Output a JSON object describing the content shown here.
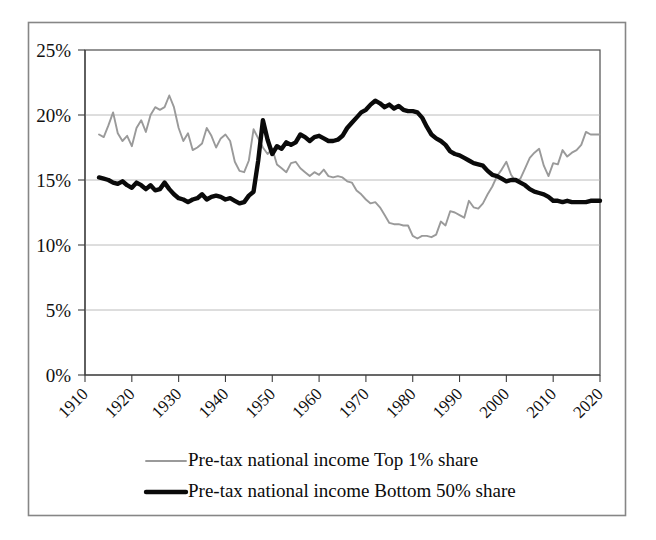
{
  "chart_data": {
    "type": "line",
    "title": "",
    "subtitle": "",
    "xlabel": "",
    "ylabel": "",
    "xlim": [
      1910,
      2020
    ],
    "ylim": [
      0,
      25
    ],
    "grid": true,
    "legend_position": "bottom",
    "y_tick_labels": [
      "0%",
      "5%",
      "10%",
      "15%",
      "20%",
      "25%"
    ],
    "y_tick_values": [
      0,
      5,
      10,
      15,
      20,
      25
    ],
    "x_tick_labels": [
      "1910",
      "1920",
      "1930",
      "1940",
      "1950",
      "1960",
      "1970",
      "1980",
      "1990",
      "2000",
      "2010",
      "2020"
    ],
    "x_tick_values": [
      1910,
      1920,
      1930,
      1940,
      1950,
      1960,
      1970,
      1980,
      1990,
      2000,
      2010,
      2020
    ],
    "x": [
      1913,
      1914,
      1915,
      1916,
      1917,
      1918,
      1919,
      1920,
      1921,
      1922,
      1923,
      1924,
      1925,
      1926,
      1927,
      1928,
      1929,
      1930,
      1931,
      1932,
      1933,
      1934,
      1935,
      1936,
      1937,
      1938,
      1939,
      1940,
      1941,
      1942,
      1943,
      1944,
      1945,
      1946,
      1947,
      1948,
      1949,
      1950,
      1951,
      1952,
      1953,
      1954,
      1955,
      1956,
      1957,
      1958,
      1959,
      1960,
      1961,
      1962,
      1963,
      1964,
      1965,
      1966,
      1967,
      1968,
      1969,
      1970,
      1971,
      1972,
      1973,
      1974,
      1975,
      1976,
      1977,
      1978,
      1979,
      1980,
      1981,
      1982,
      1983,
      1984,
      1985,
      1986,
      1987,
      1988,
      1989,
      1990,
      1991,
      1992,
      1993,
      1994,
      1995,
      1996,
      1997,
      1998,
      1999,
      2000,
      2001,
      2002,
      2003,
      2004,
      2005,
      2006,
      2007,
      2008,
      2009,
      2010,
      2011,
      2012,
      2013,
      2014,
      2015,
      2016,
      2017,
      2018,
      2019,
      2020
    ],
    "series": [
      {
        "name": "Pre-tax national income Top 1%  share",
        "color": "#9a9a9a",
        "linewidth": 1.9,
        "values": [
          18.5,
          18.3,
          19.2,
          20.2,
          18.6,
          18.0,
          18.4,
          17.6,
          19.0,
          19.6,
          18.7,
          20.0,
          20.6,
          20.4,
          20.6,
          21.5,
          20.6,
          19.0,
          18.0,
          18.6,
          17.3,
          17.5,
          17.8,
          19.0,
          18.4,
          17.5,
          18.2,
          18.5,
          18.0,
          16.4,
          15.7,
          15.6,
          16.5,
          18.9,
          18.2,
          17.5,
          17.0,
          17.4,
          16.2,
          15.9,
          15.6,
          16.3,
          16.4,
          15.9,
          15.6,
          15.3,
          15.6,
          15.4,
          15.8,
          15.3,
          15.2,
          15.3,
          15.2,
          14.9,
          14.8,
          14.2,
          13.9,
          13.5,
          13.2,
          13.3,
          12.9,
          12.3,
          11.7,
          11.6,
          11.6,
          11.5,
          11.5,
          10.7,
          10.5,
          10.7,
          10.7,
          10.6,
          10.8,
          11.8,
          11.5,
          12.6,
          12.5,
          12.3,
          12.1,
          13.4,
          12.9,
          12.8,
          13.2,
          13.9,
          14.5,
          15.3,
          15.8,
          16.4,
          15.4,
          14.9,
          15.1,
          15.9,
          16.7,
          17.1,
          17.4,
          16.1,
          15.3,
          16.3,
          16.2,
          17.3,
          16.8,
          17.1,
          17.3,
          17.7,
          18.7,
          18.5,
          18.5,
          18.5
        ]
      },
      {
        "name": "Pre-tax national income Bottom 50% share",
        "color": "#0a0a0a",
        "linewidth": 4.4,
        "values": [
          15.2,
          15.1,
          15.0,
          14.8,
          14.7,
          14.9,
          14.6,
          14.4,
          14.8,
          14.6,
          14.3,
          14.6,
          14.2,
          14.3,
          14.8,
          14.3,
          13.9,
          13.6,
          13.5,
          13.3,
          13.5,
          13.6,
          13.9,
          13.5,
          13.7,
          13.8,
          13.7,
          13.5,
          13.6,
          13.4,
          13.2,
          13.3,
          13.8,
          14.1,
          16.5,
          19.6,
          18.1,
          17.0,
          17.6,
          17.4,
          17.9,
          17.7,
          17.9,
          18.5,
          18.3,
          18.0,
          18.3,
          18.4,
          18.2,
          18.0,
          18.0,
          18.1,
          18.4,
          19.0,
          19.4,
          19.8,
          20.2,
          20.4,
          20.8,
          21.1,
          20.9,
          20.6,
          20.8,
          20.5,
          20.7,
          20.4,
          20.3,
          20.3,
          20.2,
          19.8,
          19.1,
          18.5,
          18.2,
          18.0,
          17.7,
          17.2,
          17.0,
          16.9,
          16.7,
          16.5,
          16.3,
          16.2,
          16.1,
          15.7,
          15.4,
          15.3,
          15.1,
          14.9,
          15.0,
          15.0,
          14.8,
          14.6,
          14.3,
          14.1,
          14.0,
          13.9,
          13.7,
          13.4,
          13.4,
          13.3,
          13.4,
          13.3,
          13.3,
          13.3,
          13.3,
          13.4,
          13.4,
          13.4
        ]
      }
    ]
  },
  "legend": {
    "entries": [
      {
        "label": "Pre-tax national income Top 1%  share",
        "swatch": "gray-thin-line"
      },
      {
        "label": "Pre-tax national income Bottom 50% share",
        "swatch": "black-thick-line"
      }
    ]
  }
}
